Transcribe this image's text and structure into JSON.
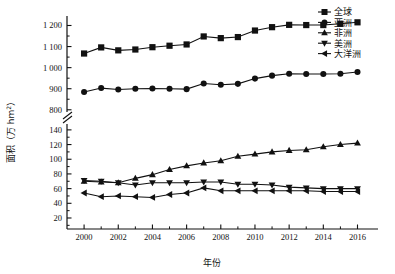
{
  "chart_data": {
    "type": "line",
    "title": "",
    "xlabel": "年份",
    "ylabel": "面积（万 hm²）",
    "x": [
      2000,
      2001,
      2002,
      2003,
      2004,
      2005,
      2006,
      2007,
      2008,
      2009,
      2010,
      2011,
      2012,
      2013,
      2014,
      2015,
      2016
    ],
    "xticks": [
      2000,
      2002,
      2004,
      2006,
      2008,
      2010,
      2012,
      2014,
      2016
    ],
    "xlim": [
      1999.0,
      2017.2
    ],
    "axis_break": true,
    "y_upper_ticks": [
      800,
      900,
      1000,
      1100,
      1200
    ],
    "y_lower_ticks": [
      20,
      40,
      60,
      80,
      100,
      120,
      140
    ],
    "ylim_upper": [
      780,
      1245
    ],
    "ylim_lower": [
      5,
      148
    ],
    "grid": false,
    "legend_position": "top-right",
    "series": [
      {
        "name": "全球",
        "marker": "square",
        "axis": "upper",
        "values": [
          1067,
          1096,
          1082,
          1086,
          1097,
          1104,
          1110,
          1148,
          1140,
          1145,
          1176,
          1192,
          1203,
          1202,
          1202,
          1208,
          1215
        ]
      },
      {
        "name": "亚洲",
        "marker": "circle",
        "axis": "upper",
        "values": [
          884,
          903,
          896,
          900,
          901,
          900,
          898,
          925,
          919,
          923,
          948,
          962,
          971,
          970,
          970,
          971,
          979
        ]
      },
      {
        "name": "非洲",
        "marker": "triangle-up",
        "axis": "lower",
        "values": [
          70,
          69,
          68,
          74,
          79,
          86,
          91,
          95,
          98,
          104,
          107,
          110,
          112,
          113,
          117,
          120,
          122
        ]
      },
      {
        "name": "美洲",
        "marker": "triangle-down",
        "axis": "lower",
        "values": [
          71,
          70,
          68,
          65,
          68,
          68,
          68,
          69,
          69,
          66,
          66,
          65,
          62,
          61,
          60,
          60,
          60
        ]
      },
      {
        "name": "大洋洲",
        "marker": "triangle-left",
        "axis": "lower",
        "values": [
          54,
          49,
          50,
          49,
          48,
          52,
          54,
          61,
          57,
          57,
          57,
          57,
          57,
          57,
          56,
          56,
          56
        ]
      }
    ]
  },
  "axis": {
    "ylabel_main": "面积",
    "ylabel_paren_open": "（万 hm",
    "ylabel_sup": "2",
    "ylabel_paren_close": "）",
    "xlabel": "年份"
  }
}
